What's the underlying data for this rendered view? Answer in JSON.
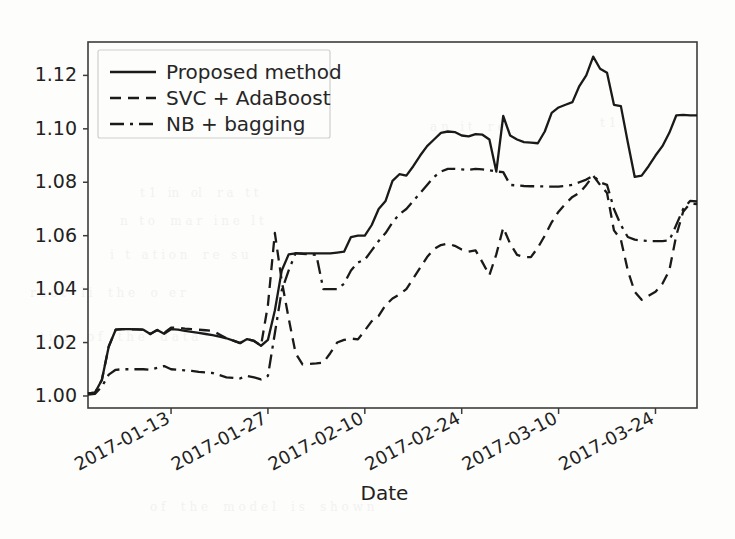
{
  "figure": {
    "background_color": "#fdfdfb",
    "line_color": "#1a1a1a",
    "axis_color": "#3c3c3c"
  },
  "chart_data": {
    "type": "line",
    "title": "",
    "xlabel": "Date",
    "ylabel": "",
    "grid": false,
    "legend_position": "upper left",
    "xtick_labels": [
      "2017-01-13",
      "2017-01-27",
      "2017-02-10",
      "2017-02-24",
      "2017-03-10",
      "2017-03-24"
    ],
    "xtick_values": [
      12,
      26,
      40,
      54,
      68,
      82
    ],
    "ytick_labels": [
      "1.00",
      "1.02",
      "1.04",
      "1.06",
      "1.08",
      "1.10",
      "1.12"
    ],
    "ytick_values": [
      1.0,
      1.02,
      1.04,
      1.06,
      1.08,
      1.1,
      1.12
    ],
    "xlim": [
      0,
      88
    ],
    "ylim": [
      0.9955,
      1.1325
    ],
    "series": [
      {
        "name": "Proposed method",
        "style": "solid",
        "x": [
          0,
          1,
          2,
          3,
          4,
          5,
          6,
          7,
          8,
          9,
          10,
          11,
          12,
          13,
          14,
          15,
          16,
          17,
          18,
          19,
          20,
          21,
          22,
          23,
          24,
          25,
          26,
          27,
          28,
          29,
          30,
          31,
          32,
          33,
          34,
          35,
          36,
          37,
          38,
          39,
          40,
          41,
          42,
          43,
          44,
          45,
          46,
          47,
          48,
          49,
          50,
          51,
          52,
          53,
          54,
          55,
          56,
          57,
          58,
          59,
          60,
          61,
          62,
          63,
          64,
          65,
          66,
          67,
          68,
          69,
          70,
          71,
          72,
          73,
          74,
          75,
          76,
          77,
          78,
          79,
          80,
          81,
          82,
          83,
          84,
          85,
          86,
          87,
          88
        ],
        "values": [
          1.001,
          1.0012,
          1.006,
          1.0185,
          1.0248,
          1.025,
          1.025,
          1.0249,
          1.0248,
          1.0232,
          1.0247,
          1.0233,
          1.025,
          1.0248,
          1.0244,
          1.024,
          1.0236,
          1.0232,
          1.0228,
          1.0222,
          1.0216,
          1.0207,
          1.0198,
          1.0213,
          1.0206,
          1.0188,
          1.021,
          1.032,
          1.047,
          1.053,
          1.0534,
          1.0534,
          1.0534,
          1.0534,
          1.0534,
          1.0534,
          1.0537,
          1.054,
          1.0595,
          1.06,
          1.06,
          1.064,
          1.07,
          1.073,
          1.0805,
          1.083,
          1.0825,
          1.086,
          1.09,
          1.0935,
          1.096,
          1.0985,
          1.099,
          1.0988,
          1.0975,
          1.0972,
          1.098,
          1.0978,
          1.096,
          1.084,
          1.1048,
          1.0975,
          1.096,
          1.095,
          1.0948,
          1.0946,
          1.099,
          1.106,
          1.108,
          1.109,
          1.11,
          1.116,
          1.12,
          1.127,
          1.1225,
          1.121,
          1.109,
          1.1085,
          1.095,
          1.082,
          1.0825,
          1.086,
          1.09,
          1.0935,
          1.0985,
          1.105,
          1.1052,
          1.105,
          1.105
        ]
      },
      {
        "name": "SVC + AdaBoost",
        "style": "dashed",
        "x": [
          0,
          1,
          2,
          3,
          4,
          5,
          6,
          7,
          8,
          9,
          10,
          11,
          12,
          13,
          14,
          15,
          16,
          17,
          18,
          19,
          20,
          21,
          22,
          23,
          24,
          25,
          26,
          27,
          28,
          29,
          30,
          31,
          32,
          33,
          34,
          35,
          36,
          37,
          38,
          39,
          40,
          41,
          42,
          43,
          44,
          45,
          46,
          47,
          48,
          49,
          50,
          51,
          52,
          53,
          54,
          55,
          56,
          57,
          58,
          59,
          60,
          61,
          62,
          63,
          64,
          65,
          66,
          67,
          68,
          69,
          70,
          71,
          72,
          73,
          74,
          75,
          76,
          77,
          78,
          79,
          80,
          81,
          82,
          83,
          84,
          85,
          86,
          87,
          88
        ],
        "values": [
          1.001,
          1.0012,
          1.006,
          1.0185,
          1.0248,
          1.025,
          1.025,
          1.0249,
          1.0248,
          1.0232,
          1.0247,
          1.0236,
          1.0256,
          1.0256,
          1.0252,
          1.025,
          1.0248,
          1.0246,
          1.0244,
          1.023,
          1.0216,
          1.0207,
          1.0198,
          1.0213,
          1.0206,
          1.0188,
          1.034,
          1.061,
          1.043,
          1.029,
          1.016,
          1.0118,
          1.012,
          1.0122,
          1.0125,
          1.016,
          1.02,
          1.021,
          1.0215,
          1.0212,
          1.0245,
          1.028,
          1.03,
          1.034,
          1.0365,
          1.038,
          1.04,
          1.044,
          1.048,
          1.052,
          1.055,
          1.0565,
          1.057,
          1.0562,
          1.0548,
          1.054,
          1.0545,
          1.05,
          1.0452,
          1.053,
          1.063,
          1.057,
          1.0528,
          1.052,
          1.052,
          1.0555,
          1.06,
          1.065,
          1.069,
          1.072,
          1.0745,
          1.076,
          1.079,
          1.0825,
          1.079,
          1.076,
          1.062,
          1.0585,
          1.047,
          1.039,
          1.036,
          1.0375,
          1.039,
          1.042,
          1.047,
          1.06,
          1.069,
          1.072,
          1.0718
        ]
      },
      {
        "name": "NB + bagging",
        "style": "dashdot",
        "x": [
          0,
          1,
          2,
          3,
          4,
          5,
          6,
          7,
          8,
          9,
          10,
          11,
          12,
          13,
          14,
          15,
          16,
          17,
          18,
          19,
          20,
          21,
          22,
          23,
          24,
          25,
          26,
          27,
          28,
          29,
          30,
          31,
          32,
          33,
          34,
          35,
          36,
          37,
          38,
          39,
          40,
          41,
          42,
          43,
          44,
          45,
          46,
          47,
          48,
          49,
          50,
          51,
          52,
          53,
          54,
          55,
          56,
          57,
          58,
          59,
          60,
          61,
          62,
          63,
          64,
          65,
          66,
          67,
          68,
          69,
          70,
          71,
          72,
          73,
          74,
          75,
          76,
          77,
          78,
          79,
          80,
          81,
          82,
          83,
          84,
          85,
          86,
          87,
          88
        ],
        "values": [
          1.0005,
          1.0008,
          1.0035,
          1.008,
          1.0098,
          1.01,
          1.01,
          1.01,
          1.01,
          1.0098,
          1.0105,
          1.0112,
          1.01,
          1.0098,
          1.0096,
          1.0094,
          1.009,
          1.0088,
          1.0086,
          1.0078,
          1.007,
          1.0068,
          1.0066,
          1.0075,
          1.007,
          1.0062,
          1.0075,
          1.0235,
          1.0395,
          1.047,
          1.0535,
          1.0532,
          1.053,
          1.0528,
          1.04,
          1.04,
          1.04,
          1.042,
          1.047,
          1.05,
          1.051,
          1.0545,
          1.058,
          1.061,
          1.065,
          1.068,
          1.07,
          1.073,
          1.076,
          1.079,
          1.082,
          1.084,
          1.085,
          1.085,
          1.0848,
          1.0846,
          1.085,
          1.0848,
          1.0845,
          1.084,
          1.0838,
          1.079,
          1.0788,
          1.0786,
          1.0785,
          1.0785,
          1.0784,
          1.0784,
          1.0784,
          1.0786,
          1.079,
          1.08,
          1.081,
          1.0825,
          1.08,
          1.079,
          1.07,
          1.064,
          1.0595,
          1.0585,
          1.0582,
          1.058,
          1.058,
          1.058,
          1.0582,
          1.064,
          1.07,
          1.073,
          1.0728
        ]
      }
    ]
  },
  "legend": {
    "items": [
      {
        "label": "Proposed method",
        "style": "solid"
      },
      {
        "label": "SVC + AdaBoost",
        "style": "dashed"
      },
      {
        "label": "NB + bagging",
        "style": "dashdot"
      }
    ]
  }
}
